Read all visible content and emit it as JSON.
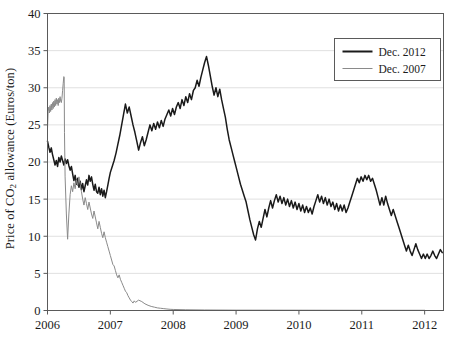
{
  "chart_data": {
    "type": "line",
    "title": "",
    "xlabel": "",
    "ylabel": "Price of CO2 allowance (Euros/ton)",
    "ylabel_prefix": "Price of CO",
    "ylabel_sub": "2",
    "ylabel_suffix": " allowance (Euros/ton)",
    "xlim": [
      2006.0,
      2012.3
    ],
    "ylim": [
      0,
      40
    ],
    "grid": true,
    "grid_axis": "y",
    "legend_position": "top-right",
    "xticks": [
      "2006",
      "2007",
      "2008",
      "2009",
      "2010",
      "2011",
      "2012"
    ],
    "xtick_values": [
      2006,
      2007,
      2008,
      2009,
      2010,
      2011,
      2012
    ],
    "yticks": [
      "0",
      "5",
      "10",
      "15",
      "20",
      "25",
      "30",
      "35",
      "40"
    ],
    "ytick_values": [
      0,
      5,
      10,
      15,
      20,
      25,
      30,
      35,
      40
    ],
    "series": [
      {
        "name": "Dec. 2012",
        "color": "#1a1a1a",
        "width": 1.5,
        "x": [
          2006.0,
          2006.02,
          2006.04,
          2006.06,
          2006.08,
          2006.1,
          2006.12,
          2006.14,
          2006.16,
          2006.18,
          2006.2,
          2006.22,
          2006.24,
          2006.26,
          2006.28,
          2006.3,
          2006.32,
          2006.34,
          2006.36,
          2006.38,
          2006.4,
          2006.42,
          2006.44,
          2006.46,
          2006.48,
          2006.5,
          2006.52,
          2006.54,
          2006.56,
          2006.58,
          2006.6,
          2006.62,
          2006.64,
          2006.66,
          2006.68,
          2006.7,
          2006.72,
          2006.74,
          2006.76,
          2006.78,
          2006.8,
          2006.82,
          2006.84,
          2006.86,
          2006.88,
          2006.9,
          2006.92,
          2006.94,
          2006.96,
          2006.98,
          2007.0,
          2007.03,
          2007.06,
          2007.09,
          2007.12,
          2007.15,
          2007.18,
          2007.21,
          2007.24,
          2007.27,
          2007.3,
          2007.33,
          2007.36,
          2007.39,
          2007.42,
          2007.45,
          2007.48,
          2007.51,
          2007.54,
          2007.57,
          2007.6,
          2007.63,
          2007.66,
          2007.69,
          2007.72,
          2007.75,
          2007.78,
          2007.81,
          2007.84,
          2007.87,
          2007.9,
          2007.93,
          2007.96,
          2007.99,
          2008.02,
          2008.05,
          2008.08,
          2008.11,
          2008.14,
          2008.17,
          2008.2,
          2008.23,
          2008.26,
          2008.29,
          2008.32,
          2008.35,
          2008.38,
          2008.41,
          2008.44,
          2008.47,
          2008.5,
          2008.53,
          2008.56,
          2008.59,
          2008.62,
          2008.65,
          2008.68,
          2008.71,
          2008.74,
          2008.77,
          2008.8,
          2008.83,
          2008.86,
          2008.89,
          2008.92,
          2008.95,
          2008.98,
          2009.01,
          2009.04,
          2009.07,
          2009.1,
          2009.13,
          2009.16,
          2009.19,
          2009.22,
          2009.25,
          2009.28,
          2009.31,
          2009.34,
          2009.37,
          2009.4,
          2009.43,
          2009.46,
          2009.49,
          2009.52,
          2009.55,
          2009.58,
          2009.61,
          2009.64,
          2009.67,
          2009.7,
          2009.73,
          2009.76,
          2009.79,
          2009.82,
          2009.85,
          2009.88,
          2009.91,
          2009.94,
          2009.97,
          2010.0,
          2010.03,
          2010.06,
          2010.09,
          2010.12,
          2010.15,
          2010.18,
          2010.21,
          2010.24,
          2010.27,
          2010.3,
          2010.33,
          2010.36,
          2010.39,
          2010.42,
          2010.45,
          2010.48,
          2010.51,
          2010.54,
          2010.57,
          2010.6,
          2010.63,
          2010.66,
          2010.69,
          2010.72,
          2010.75,
          2010.78,
          2010.81,
          2010.84,
          2010.87,
          2010.9,
          2010.93,
          2010.96,
          2010.99,
          2011.02,
          2011.05,
          2011.08,
          2011.11,
          2011.14,
          2011.17,
          2011.2,
          2011.23,
          2011.26,
          2011.29,
          2011.32,
          2011.35,
          2011.38,
          2011.41,
          2011.44,
          2011.47,
          2011.5,
          2011.53,
          2011.56,
          2011.59,
          2011.62,
          2011.65,
          2011.68,
          2011.71,
          2011.74,
          2011.77,
          2011.8,
          2011.83,
          2011.86,
          2011.89,
          2011.92,
          2011.95,
          2011.98,
          2012.01,
          2012.04,
          2012.07,
          2012.1,
          2012.13,
          2012.16,
          2012.19,
          2012.22,
          2012.25,
          2012.28
        ],
        "y": [
          22.8,
          22.0,
          21.3,
          21.9,
          21.0,
          20.3,
          19.6,
          20.2,
          19.4,
          20.6,
          20.0,
          20.8,
          20.2,
          19.6,
          20.4,
          19.8,
          20.3,
          19.5,
          18.9,
          19.4,
          18.4,
          17.5,
          18.2,
          17.0,
          17.8,
          16.6,
          17.4,
          16.3,
          17.1,
          16.0,
          16.8,
          17.6,
          16.9,
          18.2,
          17.4,
          18.0,
          17.0,
          16.2,
          17.0,
          16.0,
          15.8,
          16.6,
          15.6,
          16.4,
          15.4,
          16.2,
          15.2,
          16.0,
          16.9,
          17.8,
          18.6,
          19.4,
          20.2,
          21.2,
          22.4,
          23.6,
          25.0,
          26.4,
          27.8,
          26.6,
          27.4,
          26.2,
          25.0,
          24.0,
          22.8,
          21.6,
          22.6,
          23.4,
          22.2,
          23.0,
          24.0,
          25.0,
          24.2,
          25.2,
          24.4,
          25.4,
          24.6,
          25.6,
          24.8,
          25.8,
          26.4,
          27.0,
          26.2,
          27.2,
          26.4,
          27.4,
          28.0,
          27.2,
          28.4,
          27.6,
          28.8,
          28.0,
          29.2,
          28.4,
          29.6,
          30.0,
          31.0,
          30.2,
          31.4,
          32.4,
          33.4,
          34.2,
          33.0,
          31.6,
          30.2,
          29.0,
          30.0,
          28.8,
          29.8,
          28.4,
          27.2,
          26.0,
          24.4,
          23.0,
          22.0,
          21.0,
          20.0,
          19.0,
          18.0,
          17.0,
          16.2,
          15.4,
          14.6,
          13.4,
          12.2,
          11.2,
          10.2,
          9.5,
          11.0,
          12.0,
          11.2,
          12.4,
          13.6,
          12.6,
          13.8,
          14.8,
          13.8,
          14.8,
          15.6,
          14.6,
          15.4,
          14.4,
          15.2,
          14.2,
          15.0,
          14.0,
          14.8,
          13.8,
          14.6,
          13.6,
          14.4,
          13.4,
          14.2,
          13.2,
          14.0,
          13.2,
          13.8,
          13.0,
          14.0,
          14.8,
          15.6,
          14.6,
          15.4,
          14.4,
          15.2,
          14.2,
          15.0,
          14.0,
          14.6,
          13.6,
          14.4,
          13.4,
          14.2,
          13.4,
          14.2,
          13.2,
          13.8,
          14.6,
          15.4,
          16.2,
          17.0,
          17.8,
          17.2,
          18.0,
          17.4,
          18.2,
          17.6,
          18.2,
          17.4,
          17.8,
          17.0,
          16.2,
          15.2,
          14.2,
          15.2,
          14.2,
          15.4,
          14.4,
          13.6,
          12.8,
          13.6,
          12.8,
          12.0,
          11.2,
          10.4,
          9.6,
          8.8,
          8.0,
          8.8,
          8.0,
          7.4,
          8.2,
          9.0,
          8.2,
          7.6,
          7.0,
          7.6,
          7.0,
          7.6,
          7.0,
          7.4,
          8.0,
          7.4,
          7.0,
          7.6,
          8.2,
          7.8
        ]
      },
      {
        "name": "Dec. 2007",
        "color": "#8a8a8a",
        "width": 1.0,
        "x": [
          2006.0,
          2006.01,
          2006.02,
          2006.03,
          2006.04,
          2006.05,
          2006.06,
          2006.07,
          2006.08,
          2006.09,
          2006.1,
          2006.11,
          2006.12,
          2006.13,
          2006.14,
          2006.15,
          2006.16,
          2006.17,
          2006.18,
          2006.19,
          2006.2,
          2006.21,
          2006.22,
          2006.23,
          2006.24,
          2006.25,
          2006.26,
          2006.265,
          2006.27,
          2006.28,
          2006.3,
          2006.32,
          2006.34,
          2006.36,
          2006.38,
          2006.4,
          2006.42,
          2006.44,
          2006.46,
          2006.48,
          2006.5,
          2006.52,
          2006.54,
          2006.56,
          2006.58,
          2006.6,
          2006.62,
          2006.64,
          2006.66,
          2006.68,
          2006.7,
          2006.72,
          2006.74,
          2006.76,
          2006.78,
          2006.8,
          2006.82,
          2006.84,
          2006.86,
          2006.88,
          2006.9,
          2006.92,
          2006.94,
          2006.96,
          2006.98,
          2007.0,
          2007.02,
          2007.04,
          2007.06,
          2007.08,
          2007.1,
          2007.12,
          2007.14,
          2007.16,
          2007.18,
          2007.2,
          2007.22,
          2007.24,
          2007.26,
          2007.28,
          2007.3,
          2007.32,
          2007.34,
          2007.36,
          2007.38,
          2007.4,
          2007.45,
          2007.5,
          2007.55,
          2007.6,
          2007.65,
          2007.7,
          2007.75,
          2007.8,
          2007.85,
          2007.9,
          2007.95,
          2008.0,
          2008.2,
          2008.5,
          2009.0,
          2010.0,
          2011.0,
          2012.0
        ],
        "y": [
          24.5,
          26.8,
          27.4,
          26.6,
          27.6,
          26.8,
          27.8,
          27.0,
          28.0,
          27.2,
          28.2,
          27.4,
          28.4,
          27.6,
          28.6,
          27.8,
          28.4,
          27.6,
          28.6,
          28.0,
          28.8,
          28.2,
          28.0,
          28.6,
          29.6,
          30.6,
          31.5,
          31.4,
          24.0,
          18.0,
          13.0,
          9.6,
          13.0,
          15.6,
          16.8,
          16.0,
          17.2,
          16.4,
          17.6,
          16.8,
          18.0,
          17.0,
          16.0,
          15.0,
          14.2,
          15.2,
          14.4,
          13.6,
          14.6,
          13.8,
          13.0,
          12.4,
          13.4,
          12.6,
          11.8,
          11.0,
          12.0,
          11.2,
          10.4,
          9.8,
          10.6,
          9.8,
          9.2,
          8.6,
          8.0,
          7.4,
          6.8,
          6.2,
          6.0,
          5.4,
          4.8,
          4.4,
          4.8,
          4.2,
          3.8,
          3.4,
          3.0,
          2.6,
          2.4,
          2.0,
          1.7,
          1.4,
          1.2,
          1.0,
          1.3,
          1.1,
          1.4,
          1.2,
          0.9,
          0.7,
          0.55,
          0.45,
          0.35,
          0.3,
          0.25,
          0.2,
          0.16,
          0.14,
          0.1,
          0.07,
          0.05,
          0.04,
          0.03,
          0.03
        ]
      }
    ]
  },
  "legend": {
    "entries": [
      {
        "label": "Dec. 2012",
        "color": "#1a1a1a",
        "width": 2.0
      },
      {
        "label": "Dec. 2007",
        "color": "#8a8a8a",
        "width": 1.0
      }
    ]
  },
  "axes": {
    "frame_color": "#5a5a5a",
    "grid_color": "#d8d8d8",
    "tick_color": "#5a5a5a"
  }
}
